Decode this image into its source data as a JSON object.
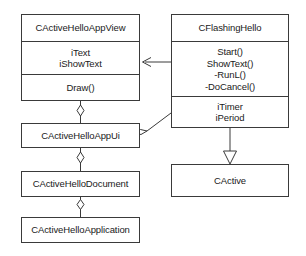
{
  "diagram": {
    "kind": "uml-class-diagram",
    "colors": {
      "background": "#ffffff",
      "line": "#3a3a3a",
      "text": "#1a1a1a",
      "fill": "#ffffff"
    },
    "classes": [
      {
        "id": "app-view",
        "name": "CActiveHelloAppView",
        "attributes": [
          "iText",
          "iShowText"
        ],
        "operations": [
          "Draw()"
        ]
      },
      {
        "id": "flashing-hello",
        "name": "CFlashingHello",
        "operations": [
          "Start()",
          "ShowText()",
          "-RunL()",
          "-DoCancel()"
        ],
        "attributes": [
          "iTimer",
          "iPeriod"
        ]
      },
      {
        "id": "app-ui",
        "name": "CActiveHelloAppUi",
        "attributes": [],
        "operations": []
      },
      {
        "id": "active",
        "name": "CActive",
        "attributes": [],
        "operations": []
      },
      {
        "id": "document",
        "name": "CActiveHelloDocument",
        "attributes": [],
        "operations": []
      },
      {
        "id": "application",
        "name": "CActiveHelloApplication",
        "attributes": [],
        "operations": []
      }
    ],
    "relationships": [
      {
        "id": "flashing-to-view",
        "type": "aggregation-directed",
        "from": "flashing-hello",
        "to": "app-view",
        "label": ""
      },
      {
        "id": "flashing-to-appui",
        "type": "aggregation",
        "from": "app-ui",
        "to": "flashing-hello",
        "label": ""
      },
      {
        "id": "view-to-appui",
        "type": "aggregation",
        "from": "app-ui",
        "to": "app-view",
        "label": ""
      },
      {
        "id": "appui-to-document",
        "type": "aggregation",
        "from": "document",
        "to": "app-ui",
        "label": ""
      },
      {
        "id": "document-to-application",
        "type": "aggregation",
        "from": "application",
        "to": "document",
        "label": ""
      },
      {
        "id": "flashing-inherits-active",
        "type": "generalization",
        "from": "flashing-hello",
        "to": "active",
        "label": ""
      }
    ]
  }
}
